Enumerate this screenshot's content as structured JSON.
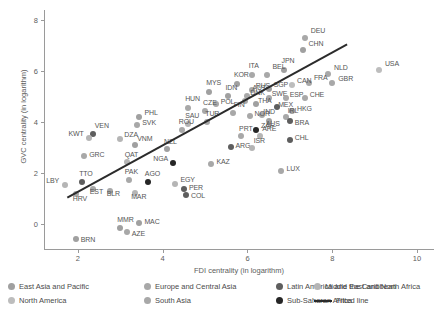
{
  "chart_data": {
    "type": "scatter",
    "title": "",
    "xlabel": "FDI centrality (in logarithm)",
    "ylabel": "GVC centrality (in logarithm)",
    "xlim": [
      1.2,
      10.4
    ],
    "ylim": [
      -1.0,
      8.4
    ],
    "xticks": [
      2,
      4,
      6,
      8,
      10
    ],
    "yticks": [
      0,
      2,
      4,
      6,
      8
    ],
    "grid": false,
    "legend_position": "bottom",
    "groups": [
      {
        "name": "East Asia and Pacific",
        "color": "#a0a0a0"
      },
      {
        "name": "Europe and Central Asia",
        "color": "#a8a8a8"
      },
      {
        "name": "Latin America and the Caribbean",
        "color": "#5e5e5e"
      },
      {
        "name": "Middle East and North Africa",
        "color": "#b5b5b5"
      },
      {
        "name": "North America",
        "color": "#bdbdbd"
      },
      {
        "name": "South Asia",
        "color": "#a8a8a8"
      },
      {
        "name": "Sub-Saharan Africa",
        "color": "#262626"
      }
    ],
    "fitted_line": {
      "label": "Fitted line",
      "color": "#2b2b2b",
      "x": [
        1.75,
        8.35
      ],
      "y": [
        1.05,
        7.05
      ]
    },
    "points": [
      {
        "code": "DEU",
        "x": 7.35,
        "y": 7.3,
        "group": "Europe and Central Asia",
        "label_dx": 6,
        "label_dy": -7
      },
      {
        "code": "CHN",
        "x": 7.3,
        "y": 6.85,
        "group": "East Asia and Pacific",
        "label_dx": 6,
        "label_dy": -6
      },
      {
        "code": "USA",
        "x": 9.1,
        "y": 6.05,
        "group": "North America",
        "label_dx": 6,
        "label_dy": -6
      },
      {
        "code": "JPN",
        "x": 6.85,
        "y": 6.05,
        "group": "East Asia and Pacific",
        "label_dx": -2,
        "label_dy": -9
      },
      {
        "code": "NLD",
        "x": 7.9,
        "y": 5.9,
        "group": "Europe and Central Asia",
        "label_dx": 6,
        "label_dy": -6
      },
      {
        "code": "GBR",
        "x": 8.0,
        "y": 5.55,
        "group": "Europe and Central Asia",
        "label_dx": 6,
        "label_dy": -4
      },
      {
        "code": "ITA",
        "x": 6.1,
        "y": 5.85,
        "group": "Europe and Central Asia",
        "label_dx": -3,
        "label_dy": -9
      },
      {
        "code": "BEL",
        "x": 6.45,
        "y": 5.85,
        "group": "Europe and Central Asia",
        "label_dx": 6,
        "label_dy": -8
      },
      {
        "code": "FRA",
        "x": 7.45,
        "y": 5.55,
        "group": "Europe and Central Asia",
        "label_dx": 5,
        "label_dy": -5
      },
      {
        "code": "CAN",
        "x": 7.05,
        "y": 5.45,
        "group": "North America",
        "label_dx": 5,
        "label_dy": -4
      },
      {
        "code": "KOR",
        "x": 5.75,
        "y": 5.5,
        "group": "East Asia and Pacific",
        "label_dx": -3,
        "label_dy": -9
      },
      {
        "code": "MYS",
        "x": 5.1,
        "y": 5.2,
        "group": "East Asia and Pacific",
        "label_dx": -3,
        "label_dy": -9
      },
      {
        "code": "SGP",
        "x": 6.5,
        "y": 5.3,
        "group": "East Asia and Pacific",
        "label_dx": 5,
        "label_dy": -4
      },
      {
        "code": "RUS",
        "x": 6.1,
        "y": 5.25,
        "group": "Europe and Central Asia",
        "label_dx": 4,
        "label_dy": -4
      },
      {
        "code": "IDN",
        "x": 5.55,
        "y": 5.05,
        "group": "East Asia and Pacific",
        "label_dx": -3,
        "label_dy": -8
      },
      {
        "code": "AUT",
        "x": 6.0,
        "y": 5.05,
        "group": "Europe and Central Asia",
        "label_dx": 5,
        "label_dy": -8
      },
      {
        "code": "SWE",
        "x": 6.5,
        "y": 4.95,
        "group": "Europe and Central Asia",
        "label_dx": 3,
        "label_dy": -4
      },
      {
        "code": "ESP",
        "x": 6.9,
        "y": 4.95,
        "group": "Europe and Central Asia",
        "label_dx": 4,
        "label_dy": -3
      },
      {
        "code": "CHE",
        "x": 7.35,
        "y": 4.95,
        "group": "Europe and Central Asia",
        "label_dx": 5,
        "label_dy": -3
      },
      {
        "code": "DNK",
        "x": 5.95,
        "y": 4.85,
        "group": "Europe and Central Asia",
        "label_dx": 0,
        "label_dy": -8
      },
      {
        "code": "POL",
        "x": 5.25,
        "y": 4.7,
        "group": "Europe and Central Asia",
        "label_dx": 5,
        "label_dy": -2
      },
      {
        "code": "THA",
        "x": 6.2,
        "y": 4.7,
        "group": "East Asia and Pacific",
        "label_dx": 2,
        "label_dy": -3
      },
      {
        "code": "HUN",
        "x": 4.6,
        "y": 4.55,
        "group": "Europe and Central Asia",
        "label_dx": -3,
        "label_dy": -9
      },
      {
        "code": "CZE",
        "x": 5.0,
        "y": 4.45,
        "group": "Europe and Central Asia",
        "label_dx": -2,
        "label_dy": -8
      },
      {
        "code": "MEX",
        "x": 6.7,
        "y": 4.6,
        "group": "Latin America and the Caribbean",
        "label_dx": 1,
        "label_dy": -2
      },
      {
        "code": "HKG",
        "x": 7.05,
        "y": 4.45,
        "group": "East Asia and Pacific",
        "label_dx": 5,
        "label_dy": -2
      },
      {
        "code": "FIN",
        "x": 5.65,
        "y": 4.35,
        "group": "Europe and Central Asia",
        "label_dx": 1,
        "label_dy": -8
      },
      {
        "code": "IND",
        "x": 6.35,
        "y": 4.3,
        "group": "South Asia",
        "label_dx": 1,
        "label_dy": -3
      },
      {
        "code": "NOR",
        "x": 6.05,
        "y": 4.25,
        "group": "Europe and Central Asia",
        "label_dx": 0,
        "label_dy": -2
      },
      {
        "code": "IRL",
        "x": 6.9,
        "y": 4.2,
        "group": "Europe and Central Asia",
        "label_dx": 2,
        "label_dy": -6
      },
      {
        "code": "AUS",
        "x": 6.5,
        "y": 4.05,
        "group": "East Asia and Pacific",
        "label_dx": -3,
        "label_dy": 3
      },
      {
        "code": "BRA",
        "x": 7.0,
        "y": 4.05,
        "group": "Latin America and the Caribbean",
        "label_dx": 5,
        "label_dy": 2
      },
      {
        "code": "TUR",
        "x": 5.05,
        "y": 4.0,
        "group": "Europe and Central Asia",
        "label_dx": -2,
        "label_dy": -8
      },
      {
        "code": "SAU",
        "x": 4.6,
        "y": 3.95,
        "group": "Middle East and North Africa",
        "label_dx": -3,
        "label_dy": -8
      },
      {
        "code": "ROU",
        "x": 4.45,
        "y": 3.7,
        "group": "Europe and Central Asia",
        "label_dx": -3,
        "label_dy": -8
      },
      {
        "code": "PHL",
        "x": 3.45,
        "y": 4.2,
        "group": "East Asia and Pacific",
        "label_dx": 5,
        "label_dy": -4
      },
      {
        "code": "SVK",
        "x": 3.4,
        "y": 3.9,
        "group": "Europe and Central Asia",
        "label_dx": 5,
        "label_dy": -2
      },
      {
        "code": "VEN",
        "x": 2.35,
        "y": 3.55,
        "group": "Latin America and the Caribbean",
        "label_dx": 2,
        "label_dy": -8
      },
      {
        "code": "KWT",
        "x": 2.25,
        "y": 3.4,
        "group": "Middle East and North Africa",
        "label_dx": -20,
        "label_dy": 0
      },
      {
        "code": "ZAF",
        "x": 6.2,
        "y": 3.7,
        "group": "Sub-Saharan Africa",
        "label_dx": 5,
        "label_dy": -4
      },
      {
        "code": "DZA",
        "x": 3.0,
        "y": 3.35,
        "group": "Middle East and North Africa",
        "label_dx": 4,
        "label_dy": -4
      },
      {
        "code": "VNM",
        "x": 3.35,
        "y": 3.1,
        "group": "East Asia and Pacific",
        "label_dx": 2,
        "label_dy": -6
      },
      {
        "code": "PRT",
        "x": 5.85,
        "y": 3.45,
        "group": "Europe and Central Asia",
        "label_dx": -2,
        "label_dy": -7
      },
      {
        "code": "ARE",
        "x": 6.3,
        "y": 3.45,
        "group": "Middle East and North Africa",
        "label_dx": 2,
        "label_dy": -7
      },
      {
        "code": "CHL",
        "x": 7.0,
        "y": 3.3,
        "group": "Latin America and the Caribbean",
        "label_dx": 5,
        "label_dy": -2
      },
      {
        "code": "ARG",
        "x": 5.6,
        "y": 3.05,
        "group": "Latin America and the Caribbean",
        "label_dx": 5,
        "label_dy": -1
      },
      {
        "code": "ISR",
        "x": 6.1,
        "y": 3.0,
        "group": "Middle East and North Africa",
        "label_dx": 2,
        "label_dy": -7
      },
      {
        "code": "GRC",
        "x": 2.15,
        "y": 2.7,
        "group": "Europe and Central Asia",
        "label_dx": 5,
        "label_dy": -1
      },
      {
        "code": "NZL",
        "x": 4.1,
        "y": 2.95,
        "group": "East Asia and Pacific",
        "label_dx": -3,
        "label_dy": -7
      },
      {
        "code": "QAT",
        "x": 3.15,
        "y": 2.45,
        "group": "Middle East and North Africa",
        "label_dx": -2,
        "label_dy": -7
      },
      {
        "code": "NGA",
        "x": 4.25,
        "y": 2.4,
        "group": "Sub-Saharan Africa",
        "label_dx": -20,
        "label_dy": 0
      },
      {
        "code": "KAZ",
        "x": 5.15,
        "y": 2.35,
        "group": "Europe and Central Asia",
        "label_dx": 5,
        "label_dy": -2
      },
      {
        "code": "LUX",
        "x": 6.8,
        "y": 2.1,
        "group": "Europe and Central Asia",
        "label_dx": 5,
        "label_dy": -2
      },
      {
        "code": "TTO",
        "x": 2.1,
        "y": 1.65,
        "group": "Latin America and the Caribbean",
        "label_dx": -3,
        "label_dy": -8
      },
      {
        "code": "LBY",
        "x": 1.7,
        "y": 1.55,
        "group": "Middle East and North Africa",
        "label_dx": -19,
        "label_dy": 0
      },
      {
        "code": "PAK",
        "x": 3.2,
        "y": 1.75,
        "group": "South Asia",
        "label_dx": -4,
        "label_dy": -8
      },
      {
        "code": "AGO",
        "x": 3.65,
        "y": 1.65,
        "group": "Sub-Saharan Africa",
        "label_dx": -3,
        "label_dy": -8
      },
      {
        "code": "EGY",
        "x": 4.3,
        "y": 1.6,
        "group": "Middle East and North Africa",
        "label_dx": 5,
        "label_dy": -4
      },
      {
        "code": "PER",
        "x": 4.5,
        "y": 1.4,
        "group": "Latin America and the Caribbean",
        "label_dx": 5,
        "label_dy": -1
      },
      {
        "code": "EST",
        "x": 2.35,
        "y": 1.4,
        "group": "Europe and Central Asia",
        "label_dx": -3,
        "label_dy": 3
      },
      {
        "code": "BLR",
        "x": 2.75,
        "y": 1.3,
        "group": "Europe and Central Asia",
        "label_dx": -3,
        "label_dy": 3
      },
      {
        "code": "MAR",
        "x": 3.35,
        "y": 1.25,
        "group": "Middle East and North Africa",
        "label_dx": -4,
        "label_dy": 4
      },
      {
        "code": "COL",
        "x": 4.55,
        "y": 1.15,
        "group": "Latin America and the Caribbean",
        "label_dx": 5,
        "label_dy": 1
      },
      {
        "code": "HRV",
        "x": 1.95,
        "y": 1.2,
        "group": "Europe and Central Asia",
        "label_dx": -3,
        "label_dy": 5
      },
      {
        "code": "MAC",
        "x": 3.45,
        "y": 0.05,
        "group": "East Asia and Pacific",
        "label_dx": 5,
        "label_dy": -1
      },
      {
        "code": "MMR",
        "x": 3.0,
        "y": -0.15,
        "group": "East Asia and Pacific",
        "label_dx": -3,
        "label_dy": -8
      },
      {
        "code": "AZE",
        "x": 3.15,
        "y": -0.3,
        "group": "Europe and Central Asia",
        "label_dx": 5,
        "label_dy": 2
      },
      {
        "code": "BRN",
        "x": 1.95,
        "y": -0.55,
        "group": "East Asia and Pacific",
        "label_dx": 5,
        "label_dy": 1
      }
    ]
  },
  "legend": {
    "row1": [
      {
        "label": "East Asia and Pacific",
        "color": "#a0a0a0",
        "type": "dot"
      },
      {
        "label": "Europe and Central Asia",
        "color": "#a8a8a8",
        "type": "dot"
      },
      {
        "label": "Latin America and the Caribbean",
        "color": "#5e5e5e",
        "type": "dot"
      },
      {
        "label": "Middle East and North Africa",
        "color": "#b5b5b5",
        "type": "dot"
      }
    ],
    "row2": [
      {
        "label": "North America",
        "color": "#bdbdbd",
        "type": "dot"
      },
      {
        "label": "South Asia",
        "color": "#a8a8a8",
        "type": "dot"
      },
      {
        "label": "Sub-Saharan Africa",
        "color": "#262626",
        "type": "dot"
      },
      {
        "label": "Fitted line",
        "color": "#2b2b2b",
        "type": "line"
      }
    ]
  }
}
